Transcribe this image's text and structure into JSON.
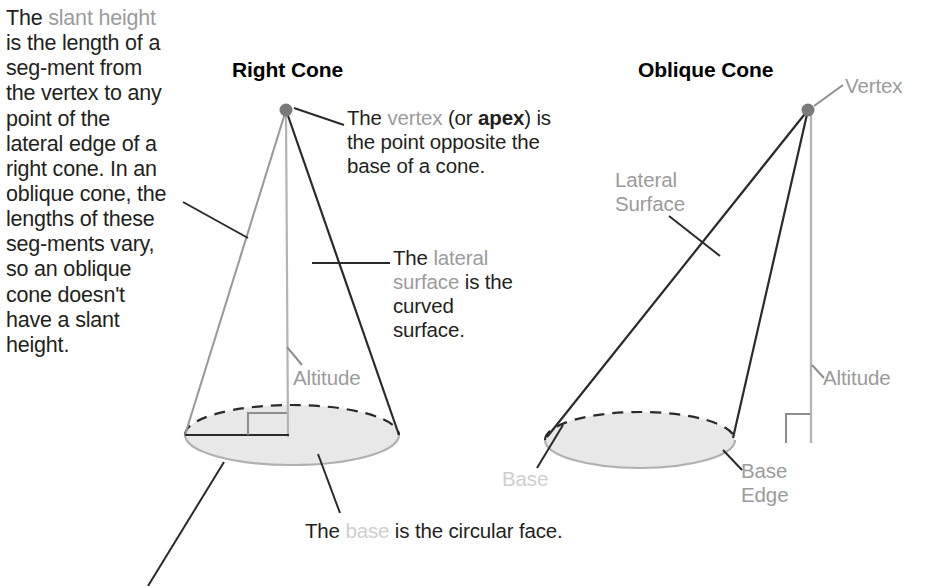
{
  "diagram": {
    "title_context": "Parts of a cone",
    "headings": {
      "right_cone": "Right Cone",
      "oblique_cone": "Oblique Cone"
    },
    "side_note": {
      "full_text": "The slant height is the length of a segment from the vertex to any point of the lateral edge of a right cone. In an oblique cone, the lengths of these segments vary, so an oblique cone doesn't have a slant height.",
      "segments": [
        {
          "text": "The ",
          "style": "normal"
        },
        {
          "text": "slant height",
          "style": "gray"
        },
        {
          "text": " is the length of a seg-ment from the vertex to any point of the lateral edge of a right cone. In an oblique cone, the lengths of these seg-ments vary, so an oblique cone doesn't have a slant height.",
          "style": "normal"
        }
      ],
      "lines": [
        "The slant",
        "height is the",
        "length of a seg-",
        "ment from the",
        "vertex to any",
        "point of the",
        "lateral edge of",
        "a right cone. In",
        "an oblique cone,",
        "the lengths of",
        "these seg-",
        "ments vary, so",
        "an oblique cone",
        "doesn't have a",
        "slant height."
      ]
    },
    "callouts": {
      "vertex": {
        "full_text": "The vertex (or apex) is the point opposite the base of a cone.",
        "pre": "The ",
        "keyword": "vertex",
        "mid": " (or ",
        "bold": "apex",
        "post": ") is the point opposite the base of a cone."
      },
      "lateral_surface": {
        "full_text": "The lateral surface is the curved surface.",
        "pre": "The ",
        "keyword": "lateral surface",
        "post": " is the curved surface."
      },
      "base": {
        "full_text": "The base is the circular face.",
        "pre": "The ",
        "keyword": "base",
        "post": " is the circular face."
      }
    },
    "labels": {
      "altitude_right": "Altitude",
      "vertex_oblique": "Vertex",
      "lateral_surface_oblique": "Lateral\nSurface",
      "lateral_surface_oblique_line1": "Lateral",
      "lateral_surface_oblique_line2": "Surface",
      "altitude_oblique": "Altitude",
      "base_oblique": "Base",
      "base_edge_oblique_line1": "Base",
      "base_edge_oblique_line2": "Edge"
    },
    "colors": {
      "text": "#231f20",
      "gray_keyword": "#9b9b9b",
      "faint_keyword": "#cfcfcf",
      "base_fill": "#e8e8e8",
      "base_stroke": "#b0b0b0",
      "dark_edge": "#2a2a2a",
      "light_edge": "#a8a8a8",
      "vertex_dot": "#7a7a7a",
      "background": "#ffffff"
    },
    "shapes": {
      "right_cone": {
        "apex": [
          286,
          110
        ],
        "base_center": [
          292,
          435
        ],
        "base_rx": 107,
        "base_ry": 30
      },
      "oblique_cone": {
        "apex": [
          808,
          110
        ],
        "base_center": [
          640,
          440
        ],
        "base_rx": 95,
        "base_ry": 28
      }
    }
  }
}
